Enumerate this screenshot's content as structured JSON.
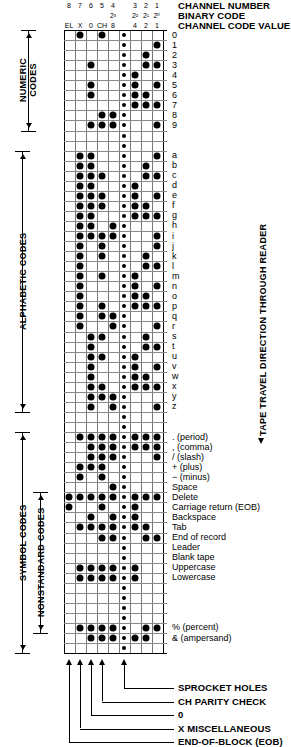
{
  "header": {
    "titles": [
      "CHANNEL NUMBER",
      "BINARY CODE",
      "CHANNEL CODE VALUE"
    ],
    "row_channel_number": [
      "8",
      "7",
      "6",
      "5",
      "4",
      "",
      "3",
      "2",
      "1"
    ],
    "row_binary_code": [
      "",
      "",
      "",
      "",
      "2³",
      "",
      "2²",
      "2¹",
      "2⁰"
    ],
    "row_channel_value": [
      "EL",
      "X",
      "0",
      "CH",
      "8",
      "",
      "4",
      "2",
      "1"
    ]
  },
  "columns": [
    {
      "key": "EL",
      "label": "EL"
    },
    {
      "key": "X",
      "label": "X"
    },
    {
      "key": "0",
      "label": "0"
    },
    {
      "key": "CH",
      "label": "CH"
    },
    {
      "key": "8",
      "label": "8"
    },
    {
      "key": "SP",
      "label": ""
    },
    {
      "key": "4",
      "label": "4"
    },
    {
      "key": "2",
      "label": "2"
    },
    {
      "key": "1",
      "label": "1"
    }
  ],
  "sections": [
    {
      "name": "NUMERIC CODES",
      "start": 0,
      "end": 9
    },
    {
      "name": "ALPHABETIC CODES",
      "start": 11,
      "end": 36
    },
    {
      "name": "SYMBOL CODES",
      "start": 38,
      "end": 50
    },
    {
      "name": "NONSTANDARD CODES",
      "start": 44,
      "end": 50
    }
  ],
  "right_label": "TAPE TRAVEL DIRECTION THROUGH READER",
  "rows": [
    {
      "label": "0",
      "holes": [
        "X",
        "CH"
      ]
    },
    {
      "label": "1",
      "holes": [
        "1"
      ]
    },
    {
      "label": "2",
      "holes": [
        "2"
      ]
    },
    {
      "label": "3",
      "holes": [
        "0",
        "2",
        "1"
      ]
    },
    {
      "label": "4",
      "holes": [
        "4"
      ]
    },
    {
      "label": "5",
      "holes": [
        "0",
        "4",
        "1"
      ]
    },
    {
      "label": "6",
      "holes": [
        "0",
        "4",
        "2"
      ]
    },
    {
      "label": "7",
      "holes": [
        "4",
        "2",
        "1"
      ]
    },
    {
      "label": "8",
      "holes": [
        "CH",
        "8"
      ]
    },
    {
      "label": "9",
      "holes": [
        "0",
        "CH",
        "8",
        "1"
      ]
    },
    {
      "label": "",
      "holes": []
    },
    {
      "label": "",
      "holes": []
    },
    {
      "label": "a",
      "holes": [
        "X",
        "0",
        "1"
      ]
    },
    {
      "label": "b",
      "holes": [
        "X",
        "0",
        "2"
      ]
    },
    {
      "label": "c",
      "holes": [
        "X",
        "0",
        "CH",
        "2",
        "1"
      ]
    },
    {
      "label": "d",
      "holes": [
        "X",
        "0",
        "4"
      ]
    },
    {
      "label": "e",
      "holes": [
        "X",
        "0",
        "CH",
        "4",
        "1"
      ]
    },
    {
      "label": "f",
      "holes": [
        "X",
        "0",
        "CH",
        "4",
        "2"
      ]
    },
    {
      "label": "g",
      "holes": [
        "X",
        "0",
        "4",
        "2",
        "1"
      ]
    },
    {
      "label": "h",
      "holes": [
        "X",
        "0",
        "8"
      ]
    },
    {
      "label": "i",
      "holes": [
        "X",
        "0",
        "CH",
        "8",
        "1"
      ]
    },
    {
      "label": "j",
      "holes": [
        "X",
        "CH",
        "1"
      ]
    },
    {
      "label": "k",
      "holes": [
        "X",
        "CH",
        "2"
      ]
    },
    {
      "label": "l",
      "holes": [
        "X",
        "2",
        "1"
      ]
    },
    {
      "label": "m",
      "holes": [
        "X",
        "CH",
        "4"
      ]
    },
    {
      "label": "n",
      "holes": [
        "X",
        "4",
        "1"
      ]
    },
    {
      "label": "o",
      "holes": [
        "X",
        "4",
        "2"
      ]
    },
    {
      "label": "p",
      "holes": [
        "X",
        "CH",
        "4",
        "2",
        "1"
      ]
    },
    {
      "label": "q",
      "holes": [
        "X",
        "CH",
        "8"
      ]
    },
    {
      "label": "r",
      "holes": [
        "X",
        "8",
        "1"
      ]
    },
    {
      "label": "s",
      "holes": [
        "0",
        "CH",
        "2"
      ]
    },
    {
      "label": "t",
      "holes": [
        "0",
        "2",
        "1"
      ]
    },
    {
      "label": "u",
      "holes": [
        "0",
        "CH",
        "4"
      ]
    },
    {
      "label": "v",
      "holes": [
        "0",
        "4",
        "1"
      ]
    },
    {
      "label": "w",
      "holes": [
        "0",
        "4",
        "2"
      ]
    },
    {
      "label": "x",
      "holes": [
        "0",
        "CH",
        "4",
        "2",
        "1"
      ]
    },
    {
      "label": "y",
      "holes": [
        "0",
        "CH",
        "8"
      ]
    },
    {
      "label": "z",
      "holes": [
        "0",
        "8",
        "1"
      ]
    },
    {
      "label": "",
      "holes": []
    },
    {
      "label": "",
      "holes": []
    },
    {
      "label": ". (period)",
      "holes": [
        "X",
        "0",
        "CH",
        "8",
        "4",
        "2",
        "1"
      ]
    },
    {
      "label": ", (comma)",
      "holes": [
        "0",
        "CH",
        "8",
        "4",
        "2",
        "1"
      ]
    },
    {
      "label": "/ (slash)",
      "holes": [
        "0",
        "CH",
        "8",
        "1"
      ]
    },
    {
      "label": "+ (plus)",
      "holes": [
        "X",
        "0",
        "CH"
      ]
    },
    {
      "label": "− (minus)",
      "holes": [
        "X",
        "CH"
      ]
    },
    {
      "label": "Space",
      "holes": [
        "8"
      ]
    },
    {
      "label": "Delete",
      "holes": [
        "EL",
        "X",
        "0",
        "CH",
        "8",
        "4",
        "2",
        "1"
      ]
    },
    {
      "label": "Carriage return (EOB)",
      "holes": [
        "EL",
        "CH",
        "4"
      ]
    },
    {
      "label": "Backspace",
      "holes": [
        "0",
        "8",
        "4"
      ]
    },
    {
      "label": "Tab",
      "holes": [
        "X",
        "0",
        "CH",
        "8",
        "4",
        "2"
      ]
    },
    {
      "label": "End of record",
      "holes": [
        "CH",
        "8",
        "2",
        "1"
      ]
    },
    {
      "label": "Leader",
      "holes": []
    },
    {
      "label": "Blank tape",
      "holes": []
    },
    {
      "label": "Uppercase",
      "holes": [
        "X",
        "0",
        "CH",
        "8",
        "4"
      ]
    },
    {
      "label": "Lowercase",
      "holes": [
        "X",
        "0",
        "CH",
        "8",
        "4"
      ]
    },
    {
      "label": "",
      "holes": []
    },
    {
      "label": "",
      "holes": []
    },
    {
      "label": "",
      "holes": []
    },
    {
      "label": "",
      "holes": []
    },
    {
      "label": "% (percent)",
      "holes": [
        "X",
        "0",
        "CH",
        "8",
        "2",
        "1"
      ]
    },
    {
      "label": "& (ampersand)",
      "holes": [
        "0",
        "CH",
        "8",
        "4",
        "2"
      ]
    },
    {
      "label": "",
      "holes": []
    }
  ],
  "footnotes": [
    {
      "text": "SPROCKET HOLES",
      "col": "SP"
    },
    {
      "text": "CH PARITY CHECK",
      "col": "CH"
    },
    {
      "text": "0",
      "col": "0"
    },
    {
      "text": "X MISCELLANEOUS",
      "col": "X"
    },
    {
      "text": "END-OF-BLOCK (EOB)",
      "col": "EL"
    }
  ]
}
